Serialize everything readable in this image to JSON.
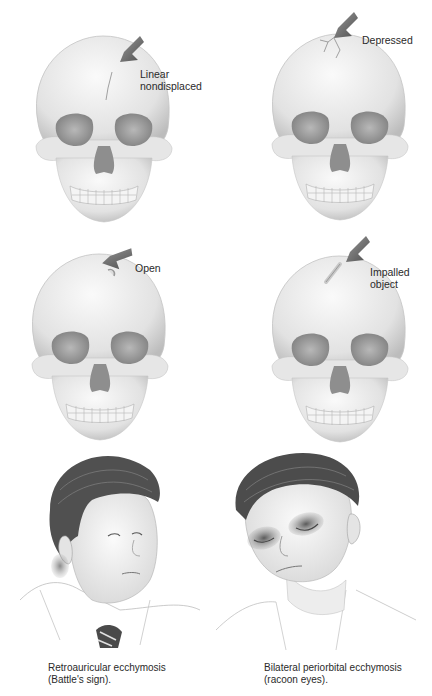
{
  "figure": {
    "skulls": [
      {
        "id": "linear",
        "label_line1": "Linear",
        "label_line2": "nondisplaced"
      },
      {
        "id": "depressed",
        "label_line1": "Depressed",
        "label_line2": ""
      },
      {
        "id": "open",
        "label_line1": "Open",
        "label_line2": ""
      },
      {
        "id": "impalled",
        "label_line1": "Impalled",
        "label_line2": "object"
      }
    ],
    "faces": [
      {
        "id": "battle-sign",
        "caption_line1": "Retroauricular ecchymosis",
        "caption_line2": "(Battle's sign)."
      },
      {
        "id": "racoon-eyes",
        "caption_line1": "Bilateral periorbital ecchymosis",
        "caption_line2": "(racoon eyes)."
      }
    ],
    "colors": {
      "bone": "#ececec",
      "bone_shadow": "#bdbdbd",
      "arrow": "#6a6a6a",
      "hair": "#4a4a4a",
      "bruise": "#5a5a5a"
    }
  }
}
